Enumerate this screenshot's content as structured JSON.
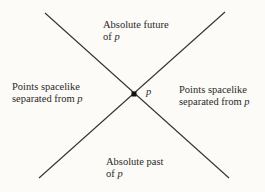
{
  "diagram": {
    "type": "light-cone",
    "event": {
      "label": "p",
      "x": 134,
      "y": 94
    },
    "lines": [
      {
        "name": "worldline-a",
        "x1": 45,
        "y1": 13,
        "x2": 229,
        "y2": 178
      },
      {
        "name": "worldline-b",
        "x1": 225,
        "y1": 12,
        "x2": 39,
        "y2": 178
      }
    ],
    "regions": {
      "future": {
        "line1": "Absolute future",
        "line2_prefix": "of ",
        "var": "p"
      },
      "past": {
        "line1": "Absolute past",
        "line2_prefix": "of ",
        "var": "p"
      },
      "left": {
        "line1": "Points spacelike",
        "line2_prefix": "separated from ",
        "var": "p"
      },
      "right": {
        "line1": "Points spacelike",
        "line2_prefix": "separated from ",
        "var": "p"
      }
    },
    "colors": {
      "line": "#333333",
      "background": "#fcfbf7",
      "text": "#2a2a2a"
    }
  }
}
